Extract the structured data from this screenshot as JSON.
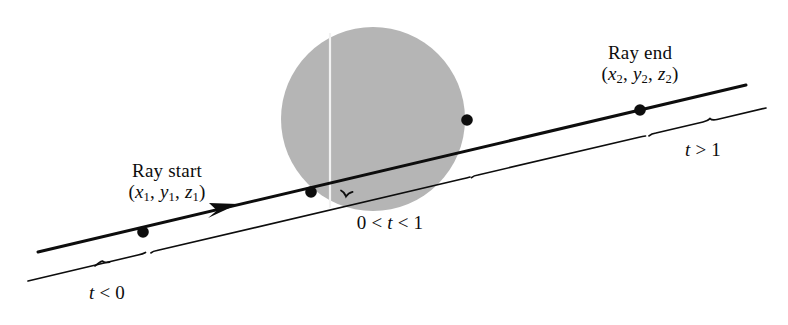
{
  "figure": {
    "name": "ray-sphere-intersection-diagram",
    "background_color": "#ffffff",
    "line_color": "#0d0d0d",
    "sphere_fill_color": "#b5b5b5",
    "text_color": "#0d0d0d"
  },
  "labels": {
    "ray_start_title": "Ray start",
    "ray_start_coords_open": "(",
    "ray_start_x": "x",
    "ray_start_x_sub": "1",
    "ray_start_sep1": ", ",
    "ray_start_y": "y",
    "ray_start_y_sub": "1",
    "ray_start_sep2": ", ",
    "ray_start_z": "z",
    "ray_start_z_sub": "1",
    "ray_start_coords_close": ")",
    "ray_end_title": "Ray end",
    "ray_end_coords_open": "(",
    "ray_end_x": "x",
    "ray_end_x_sub": "2",
    "ray_end_sep1": ", ",
    "ray_end_y": "y",
    "ray_end_y_sub": "2",
    "ray_end_sep2": ", ",
    "ray_end_z": "z",
    "ray_end_z_sub": "2",
    "ray_end_coords_close": ")",
    "t_before_pre": "",
    "t_before_var": "t",
    "t_before_rel": " < 0",
    "t_inside_pre": "0 < ",
    "t_inside_var": "t",
    "t_inside_rel": " < 1",
    "t_after_pre": "",
    "t_after_var": "t",
    "t_after_rel": " > 1"
  },
  "geometry": {
    "ray_line": {
      "x1": 38,
      "y1": 252,
      "x2": 746,
      "y2": 85
    },
    "brace_line_left": {
      "x1": 28,
      "y1": 281,
      "x2": 145,
      "y2": 253
    },
    "brace_line_mid": {
      "x1": 157,
      "y1": 250,
      "x2": 470,
      "y2": 177
    },
    "brace_line_right_a": {
      "x1": 478,
      "y1": 175,
      "x2": 645,
      "y2": 136
    },
    "brace_line_right_b": {
      "x1": 656,
      "y1": 133,
      "x2": 766,
      "y2": 108
    },
    "sphere": {
      "cx": 373,
      "cy": 119,
      "r": 92
    },
    "white_scan_line": {
      "x": 330,
      "y1": 33,
      "y2": 208
    },
    "dot_ray_start": {
      "cx": 143,
      "cy": 232,
      "r": 5.5
    },
    "dot_entry": {
      "cx": 311,
      "cy": 192,
      "r": 5.5
    },
    "dot_exit": {
      "cx": 467,
      "cy": 120,
      "r": 5.5
    },
    "dot_ray_end": {
      "cx": 640,
      "cy": 110,
      "r": 5.5
    },
    "arrowhead": {
      "x": 212,
      "y": 210
    }
  }
}
